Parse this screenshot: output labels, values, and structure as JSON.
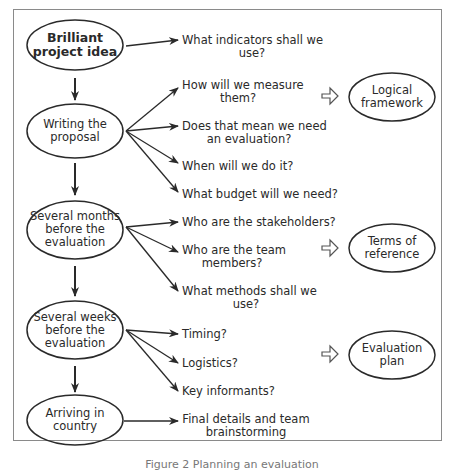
{
  "diagram": {
    "stages": [
      {
        "label_line1": "Brilliant",
        "label_line2": "project idea",
        "label_line3": ""
      },
      {
        "label_line1": "Writing the",
        "label_line2": "proposal",
        "label_line3": ""
      },
      {
        "label_line1": "Several months",
        "label_line2": "before the",
        "label_line3": "evaluation"
      },
      {
        "label_line1": "Several weeks",
        "label_line2": "before the",
        "label_line3": "evaluation"
      },
      {
        "label_line1": "Arriving in",
        "label_line2": "country",
        "label_line3": ""
      }
    ],
    "questions": [
      {
        "line1": "What indicators shall we",
        "line2": "use?"
      },
      {
        "line1": "How will we measure",
        "line2": "them?"
      },
      {
        "line1": "Does that mean we need",
        "line2": "an evaluation?"
      },
      {
        "line1": "When will we do it?",
        "line2": ""
      },
      {
        "line1": "What budget will we need?",
        "line2": ""
      },
      {
        "line1": "Who are the stakeholders?",
        "line2": ""
      },
      {
        "line1": "Who are the team",
        "line2": "members?"
      },
      {
        "line1": "What methods shall we",
        "line2": "use?"
      },
      {
        "line1": "Timing?",
        "line2": ""
      },
      {
        "line1": "Logistics?",
        "line2": ""
      },
      {
        "line1": "Key informants?",
        "line2": ""
      },
      {
        "line1": "Final details and team",
        "line2": "brainstorming"
      }
    ],
    "outputs": [
      {
        "line1": "Logical",
        "line2": "framework"
      },
      {
        "line1": "Terms of",
        "line2": "reference"
      },
      {
        "line1": "Evaluation",
        "line2": "plan"
      }
    ],
    "caption": "Figure 2 Planning an evaluation"
  }
}
